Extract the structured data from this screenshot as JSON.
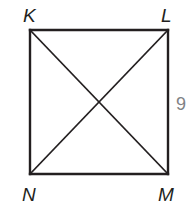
{
  "diagram": {
    "type": "square-with-diagonals",
    "vertices": {
      "K": {
        "label": "K",
        "x": 30,
        "y": 30
      },
      "L": {
        "label": "L",
        "x": 168,
        "y": 30
      },
      "M": {
        "label": "M",
        "x": 168,
        "y": 174
      },
      "N": {
        "label": "N",
        "x": 30,
        "y": 174
      }
    },
    "sides": [
      "KL",
      "LM",
      "MN",
      "NK"
    ],
    "diagonals": [
      "KM",
      "LN"
    ],
    "measurements": [
      {
        "segment": "LM",
        "value": "9",
        "color": "#808285"
      }
    ],
    "colors": {
      "line": "#231f20",
      "label": "#231f20",
      "measurement": "#808285"
    }
  }
}
